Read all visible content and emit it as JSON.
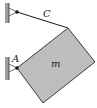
{
  "diagram": {
    "type": "mechanics-free-body",
    "labels": {
      "cable": "C",
      "pin": "A",
      "mass": "m"
    },
    "colors": {
      "block_fill": "#bdbdbd",
      "block_stroke": "#2a2a2a",
      "wall_fill": "#9e9e9e",
      "line": "#1a1a1a",
      "background": "#ffffff"
    },
    "geometry": {
      "block_vertices": [
        [
          68,
          28
        ],
        [
          95,
          62
        ],
        [
          43,
          103
        ],
        [
          17,
          68
        ]
      ],
      "cable_start": [
        17,
        12
      ],
      "cable_end": [
        68,
        28
      ],
      "pin_A": [
        17,
        68
      ],
      "upper_wall": {
        "x": 5,
        "y": 3,
        "w": 4,
        "h": 20
      },
      "lower_wall": {
        "x": 5,
        "y": 57,
        "w": 4,
        "h": 23
      }
    }
  }
}
